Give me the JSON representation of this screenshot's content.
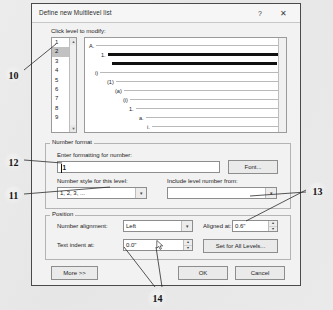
{
  "dialog": {
    "title": "Define new Multilevel list",
    "help_icon": "?",
    "close_icon": "✕"
  },
  "level_section": {
    "label": "Click level to modify:",
    "items": [
      "1",
      "2",
      "3",
      "4",
      "5",
      "6",
      "7",
      "8",
      "9"
    ],
    "selected": "2",
    "scroll_up_icon": "▲",
    "scroll_down_icon": "▼"
  },
  "preview": {
    "rows": [
      {
        "num": "A.",
        "indent": 4,
        "width": 186,
        "selected": false
      },
      {
        "num": "1.",
        "indent": 16,
        "width": 174,
        "selected": true
      },
      {
        "num": "",
        "indent": 25,
        "width": 165,
        "selected": true
      },
      {
        "num": "i)",
        "indent": 10,
        "width": 180,
        "selected": false
      },
      {
        "num": "(1)",
        "indent": 22,
        "width": 168,
        "selected": false
      },
      {
        "num": "(a)",
        "indent": 30,
        "width": 160,
        "selected": false
      },
      {
        "num": "(i)",
        "indent": 38,
        "width": 152,
        "selected": false
      },
      {
        "num": "1.",
        "indent": 44,
        "width": 146,
        "selected": false
      },
      {
        "num": "a.",
        "indent": 54,
        "width": 136,
        "selected": false
      },
      {
        "num": "i.",
        "indent": 62,
        "width": 128,
        "selected": false
      }
    ]
  },
  "number_format": {
    "group_title": "Number format",
    "enter_formatting_label": "Enter formatting for number:",
    "enter_formatting_value": "1",
    "font_button": "Font...",
    "number_style_label": "Number style for this level:",
    "number_style_value": "1, 2, 3, ...",
    "include_level_label": "Include level number from:",
    "include_level_value": "",
    "dropdown_arrow_icon": "▾"
  },
  "position": {
    "group_title": "Position",
    "number_alignment_label": "Number alignment:",
    "number_alignment_value": "Left",
    "aligned_at_label": "Aligned at:",
    "aligned_at_value": "0.6\"",
    "text_indent_label": "Text indent at:",
    "text_indent_value": "0.0\"",
    "set_all_levels_button": "Set for All Levels...",
    "dropdown_arrow_icon": "▾",
    "spin_up_icon": "▲",
    "spin_down_icon": "▼"
  },
  "footer": {
    "more_button": "More >>",
    "ok_button": "OK",
    "cancel_button": "Cancel"
  },
  "annotations": [
    {
      "id": "10",
      "label": "10"
    },
    {
      "id": "12",
      "label": "12"
    },
    {
      "id": "11",
      "label": "11"
    },
    {
      "id": "13",
      "label": "13"
    },
    {
      "id": "14",
      "label": "14"
    }
  ]
}
